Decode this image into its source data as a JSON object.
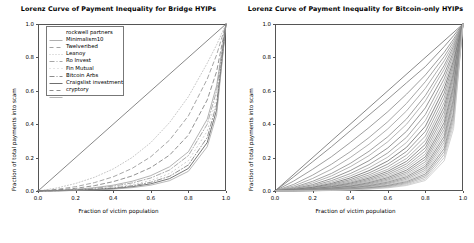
{
  "figure": {
    "width": 474,
    "height": 243,
    "background": "#ffffff"
  },
  "panels": [
    {
      "name": "bridge-hyips",
      "title": "Lorenz Curve of Payment Inequality for Bridge HYIPs",
      "xlabel": "Fraction of victim population",
      "ylabel": "Fraction of total payments into scam",
      "xticks": [
        "0.0",
        "0.2",
        "0.4",
        "0.6",
        "0.8",
        "1.0"
      ],
      "yticks": [
        "0.0",
        "0.2",
        "0.4",
        "0.6",
        "0.8",
        "1.0"
      ],
      "legend_title": "",
      "legend": [
        {
          "label": "rockwell partners",
          "dash": "none",
          "color": "#9a9a9a"
        },
        {
          "label": "Minimalism10",
          "dash": "4,3",
          "color": "#8a8a8a"
        },
        {
          "label": "Twelveribed",
          "dash": "1,2",
          "color": "#b4b4b4"
        },
        {
          "label": "Leanoy",
          "dash": "5,2,1,2",
          "color": "#8f8f8f"
        },
        {
          "label": "Ro Invest",
          "dash": "1,3",
          "color": "#bcbcbc"
        },
        {
          "label": "Fin Mutual",
          "dash": "5,2,1,2",
          "color": "#6f6f6f"
        },
        {
          "label": "Bitcoin Arbs",
          "dash": "none",
          "color": "#4a4a4a"
        },
        {
          "label": "Craigslist investment",
          "dash": "4,3",
          "color": "#707070"
        },
        {
          "label": "cryptory",
          "dash": "none",
          "color": "#a0a0a0"
        }
      ]
    },
    {
      "name": "bitcoin-only-hyips",
      "title": "Lorenz Curve of Payment Inequality for Bitcoin-only HYIPs",
      "xlabel": "Fraction of victim population",
      "ylabel": "Fraction of total payments into scam",
      "xticks": [
        "0.0",
        "0.2",
        "0.4",
        "0.6",
        "0.8",
        "1.0"
      ],
      "yticks": [
        "0.0",
        "0.2",
        "0.4",
        "0.6",
        "0.8",
        "1.0"
      ],
      "legend": []
    }
  ],
  "chart_data": [
    {
      "type": "line",
      "panel": "bridge-hyips",
      "title": "Lorenz Curve of Payment Inequality for Bridge HYIPs",
      "xlabel": "Fraction of victim population",
      "ylabel": "Fraction of total payments into scam",
      "xlim": [
        0.0,
        1.0
      ],
      "ylim": [
        0.0,
        1.0
      ],
      "grid": false,
      "legend_position": "upper left",
      "x": [
        0.0,
        0.1,
        0.2,
        0.3,
        0.4,
        0.5,
        0.6,
        0.7,
        0.8,
        0.9,
        0.95,
        1.0
      ],
      "reference_line": {
        "name": "line of equality",
        "x": [
          0.0,
          1.0
        ],
        "y": [
          0.0,
          1.0
        ],
        "color": "#555555",
        "dash": "none"
      },
      "series": [
        {
          "name": "rockwell partners",
          "dash": "none",
          "color": "#9a9a9a",
          "values": [
            0.0,
            0.004,
            0.01,
            0.02,
            0.035,
            0.058,
            0.092,
            0.145,
            0.235,
            0.43,
            0.63,
            1.0
          ]
        },
        {
          "name": "Minimalism10",
          "dash": "4,3",
          "color": "#8a8a8a",
          "values": [
            0.0,
            0.01,
            0.026,
            0.05,
            0.085,
            0.135,
            0.205,
            0.305,
            0.45,
            0.67,
            0.815,
            1.0
          ]
        },
        {
          "name": "Twelveribed",
          "dash": "1,2",
          "color": "#b4b4b4",
          "values": [
            0.0,
            0.018,
            0.045,
            0.082,
            0.132,
            0.2,
            0.29,
            0.41,
            0.565,
            0.765,
            0.875,
            1.0
          ]
        },
        {
          "name": "Leanoy",
          "dash": "5,2,1,2",
          "color": "#8f8f8f",
          "values": [
            0.0,
            0.003,
            0.008,
            0.016,
            0.029,
            0.048,
            0.078,
            0.126,
            0.212,
            0.4,
            0.6,
            1.0
          ]
        },
        {
          "name": "Ro Invest",
          "dash": "1,3",
          "color": "#bcbcbc",
          "values": [
            0.0,
            0.002,
            0.006,
            0.012,
            0.022,
            0.038,
            0.063,
            0.105,
            0.182,
            0.358,
            0.56,
            1.0
          ]
        },
        {
          "name": "Fin Mutual",
          "dash": "5,2,1,2",
          "color": "#6f6f6f",
          "values": [
            0.0,
            0.002,
            0.005,
            0.01,
            0.018,
            0.031,
            0.052,
            0.088,
            0.156,
            0.32,
            0.52,
            1.0
          ]
        },
        {
          "name": "Bitcoin Arbs",
          "dash": "none",
          "color": "#4a4a4a",
          "values": [
            0.0,
            0.001,
            0.004,
            0.008,
            0.014,
            0.025,
            0.043,
            0.074,
            0.135,
            0.29,
            0.485,
            1.0
          ]
        },
        {
          "name": "Craigslist investment",
          "dash": "4,3",
          "color": "#707070",
          "values": [
            0.0,
            0.006,
            0.016,
            0.032,
            0.056,
            0.09,
            0.14,
            0.215,
            0.335,
            0.545,
            0.715,
            1.0
          ]
        },
        {
          "name": "cryptory",
          "dash": "none",
          "color": "#a0a0a0",
          "values": [
            0.0,
            0.001,
            0.003,
            0.006,
            0.011,
            0.02,
            0.035,
            0.062,
            0.118,
            0.265,
            0.455,
            1.0
          ]
        }
      ]
    },
    {
      "type": "line",
      "panel": "bitcoin-only-hyips",
      "title": "Lorenz Curve of Payment Inequality for Bitcoin-only HYIPs",
      "xlabel": "Fraction of victim population",
      "ylabel": "Fraction of total payments into scam",
      "xlim": [
        0.0,
        1.0
      ],
      "ylim": [
        0.0,
        1.0
      ],
      "grid": false,
      "legend_position": "none",
      "x": [
        0.0,
        0.1,
        0.2,
        0.3,
        0.4,
        0.5,
        0.6,
        0.7,
        0.8,
        0.9,
        0.95,
        1.0
      ],
      "reference_line": {
        "name": "line of equality",
        "x": [
          0.0,
          1.0
        ],
        "y": [
          0.0,
          1.0
        ],
        "color": "#555555",
        "dash": "none"
      },
      "series": [
        {
          "name": "curve-01",
          "color": "#6e6e6e",
          "values": [
            0.0,
            0.085,
            0.175,
            0.265,
            0.36,
            0.455,
            0.55,
            0.648,
            0.745,
            0.865,
            0.93,
            1.0
          ]
        },
        {
          "name": "curve-02",
          "color": "#7d7d7d",
          "values": [
            0.0,
            0.06,
            0.13,
            0.205,
            0.29,
            0.38,
            0.475,
            0.58,
            0.695,
            0.83,
            0.91,
            1.0
          ]
        },
        {
          "name": "curve-03",
          "color": "#888888",
          "values": [
            0.0,
            0.04,
            0.095,
            0.16,
            0.235,
            0.32,
            0.415,
            0.525,
            0.655,
            0.805,
            0.895,
            1.0
          ]
        },
        {
          "name": "curve-04",
          "color": "#949494",
          "values": [
            0.0,
            0.03,
            0.075,
            0.13,
            0.2,
            0.28,
            0.372,
            0.48,
            0.615,
            0.78,
            0.88,
            1.0
          ]
        },
        {
          "name": "curve-05",
          "color": "#828282",
          "values": [
            0.0,
            0.022,
            0.058,
            0.105,
            0.165,
            0.238,
            0.325,
            0.432,
            0.572,
            0.752,
            0.866,
            1.0
          ]
        },
        {
          "name": "curve-06",
          "color": "#9c9c9c",
          "values": [
            0.0,
            0.018,
            0.048,
            0.09,
            0.145,
            0.212,
            0.295,
            0.4,
            0.54,
            0.73,
            0.852,
            1.0
          ]
        },
        {
          "name": "curve-07",
          "color": "#737373",
          "values": [
            0.0,
            0.014,
            0.038,
            0.074,
            0.122,
            0.182,
            0.258,
            0.358,
            0.498,
            0.7,
            0.835,
            1.0
          ]
        },
        {
          "name": "curve-08",
          "color": "#868686",
          "values": [
            0.0,
            0.011,
            0.031,
            0.062,
            0.104,
            0.158,
            0.228,
            0.322,
            0.458,
            0.672,
            0.818,
            1.0
          ]
        },
        {
          "name": "curve-09",
          "color": "#a4a4a4",
          "values": [
            0.0,
            0.009,
            0.026,
            0.053,
            0.09,
            0.139,
            0.203,
            0.291,
            0.422,
            0.643,
            0.8,
            1.0
          ]
        },
        {
          "name": "curve-10",
          "color": "#5f5f5f",
          "values": [
            0.0,
            0.008,
            0.022,
            0.045,
            0.078,
            0.122,
            0.18,
            0.262,
            0.388,
            0.614,
            0.782,
            1.0
          ]
        },
        {
          "name": "curve-11",
          "color": "#7a7a7a",
          "values": [
            0.0,
            0.007,
            0.019,
            0.039,
            0.068,
            0.108,
            0.161,
            0.237,
            0.357,
            0.586,
            0.763,
            1.0
          ]
        },
        {
          "name": "curve-12",
          "color": "#8e8e8e",
          "values": [
            0.0,
            0.006,
            0.016,
            0.034,
            0.06,
            0.096,
            0.145,
            0.215,
            0.329,
            0.558,
            0.744,
            1.0
          ]
        },
        {
          "name": "curve-13",
          "color": "#9a9a9a",
          "values": [
            0.0,
            0.005,
            0.014,
            0.03,
            0.053,
            0.086,
            0.13,
            0.195,
            0.303,
            0.531,
            0.726,
            1.0
          ]
        },
        {
          "name": "curve-14",
          "color": "#6b6b6b",
          "values": [
            0.0,
            0.004,
            0.012,
            0.026,
            0.047,
            0.077,
            0.118,
            0.178,
            0.28,
            0.505,
            0.707,
            1.0
          ]
        },
        {
          "name": "curve-15",
          "color": "#808080",
          "values": [
            0.0,
            0.004,
            0.011,
            0.023,
            0.042,
            0.069,
            0.107,
            0.163,
            0.259,
            0.48,
            0.688,
            1.0
          ]
        },
        {
          "name": "curve-16",
          "color": "#919191",
          "values": [
            0.0,
            0.003,
            0.009,
            0.02,
            0.037,
            0.062,
            0.097,
            0.149,
            0.24,
            0.456,
            0.669,
            1.0
          ]
        },
        {
          "name": "curve-17",
          "color": "#a8a8a8",
          "values": [
            0.0,
            0.003,
            0.008,
            0.018,
            0.033,
            0.056,
            0.088,
            0.137,
            0.222,
            0.433,
            0.65,
            1.0
          ]
        },
        {
          "name": "curve-18",
          "color": "#6d6d6d",
          "values": [
            0.0,
            0.002,
            0.007,
            0.016,
            0.029,
            0.05,
            0.08,
            0.125,
            0.205,
            0.41,
            0.631,
            1.0
          ]
        },
        {
          "name": "curve-19",
          "color": "#858585",
          "values": [
            0.0,
            0.002,
            0.006,
            0.014,
            0.026,
            0.045,
            0.072,
            0.114,
            0.19,
            0.389,
            0.612,
            1.0
          ]
        },
        {
          "name": "curve-20",
          "color": "#969696",
          "values": [
            0.0,
            0.002,
            0.005,
            0.012,
            0.023,
            0.04,
            0.065,
            0.104,
            0.175,
            0.368,
            0.592,
            1.0
          ]
        },
        {
          "name": "curve-21",
          "color": "#b0b0b0",
          "values": [
            0.0,
            0.002,
            0.005,
            0.011,
            0.02,
            0.036,
            0.059,
            0.095,
            0.161,
            0.348,
            0.573,
            1.0
          ]
        },
        {
          "name": "curve-22",
          "color": "#787878",
          "values": [
            0.0,
            0.001,
            0.004,
            0.01,
            0.018,
            0.032,
            0.053,
            0.086,
            0.148,
            0.328,
            0.553,
            1.0
          ]
        },
        {
          "name": "curve-23",
          "color": "#8b8b8b",
          "values": [
            0.0,
            0.001,
            0.004,
            0.009,
            0.016,
            0.028,
            0.047,
            0.078,
            0.136,
            0.309,
            0.533,
            1.0
          ]
        },
        {
          "name": "curve-24",
          "color": "#9e9e9e",
          "values": [
            0.0,
            0.001,
            0.003,
            0.008,
            0.014,
            0.025,
            0.042,
            0.07,
            0.124,
            0.291,
            0.513,
            1.0
          ]
        },
        {
          "name": "curve-25",
          "color": "#b8b8b8",
          "values": [
            0.0,
            0.001,
            0.003,
            0.007,
            0.012,
            0.022,
            0.037,
            0.063,
            0.113,
            0.273,
            0.492,
            1.0
          ]
        },
        {
          "name": "curve-26",
          "color": "#7f7f7f",
          "values": [
            0.0,
            0.001,
            0.002,
            0.006,
            0.011,
            0.019,
            0.033,
            0.056,
            0.102,
            0.255,
            0.47,
            1.0
          ]
        },
        {
          "name": "curve-27",
          "color": "#929292",
          "values": [
            0.0,
            0.001,
            0.002,
            0.005,
            0.009,
            0.017,
            0.029,
            0.05,
            0.092,
            0.237,
            0.448,
            1.0
          ]
        },
        {
          "name": "curve-28",
          "color": "#a6a6a6",
          "values": [
            0.0,
            0.001,
            0.002,
            0.004,
            0.008,
            0.015,
            0.025,
            0.044,
            0.082,
            0.219,
            0.425,
            1.0
          ]
        },
        {
          "name": "curve-29",
          "color": "#bdbdbd",
          "values": [
            0.0,
            0.0,
            0.001,
            0.004,
            0.007,
            0.013,
            0.022,
            0.038,
            0.072,
            0.2,
            0.4,
            1.0
          ]
        },
        {
          "name": "curve-30",
          "color": "#c4c4c4",
          "values": [
            0.0,
            0.0,
            0.001,
            0.003,
            0.006,
            0.011,
            0.019,
            0.033,
            0.063,
            0.181,
            0.374,
            1.0
          ]
        }
      ]
    }
  ]
}
